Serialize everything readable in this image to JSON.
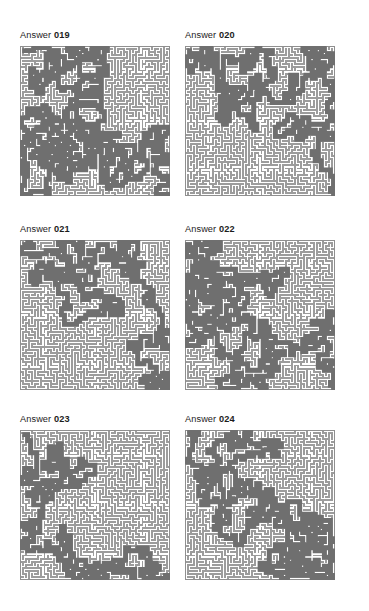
{
  "page": {
    "width": 369,
    "height": 611,
    "background": "#ffffff",
    "kind": "maze-answer-key-sheet",
    "label_prefix": "Answer"
  },
  "style": {
    "wall_color": "#9c9c9c",
    "border_color": "#8f8f8f",
    "solution_color": "#6f6f6f",
    "label_color": "#1c1c1c",
    "label_font_size_px": 9.2
  },
  "layout": {
    "columns": 2,
    "rows": 3,
    "column_x": [
      20,
      185
    ],
    "label_y": [
      30,
      224,
      414
    ],
    "maze_y": [
      46,
      240,
      430
    ],
    "maze_width": 150,
    "maze_height": 150
  },
  "panels": [
    {
      "id": "answer-019",
      "label_word": "Answer",
      "label_number": "019",
      "col": 0,
      "row": 0,
      "grid": 49,
      "seed": 19019,
      "start": [
        1,
        1
      ],
      "end": [
        48,
        48
      ],
      "entrance_side": "top-left",
      "exit_side": "bottom-right",
      "path_summary": "Descends the left quarter from the top-left, bends right across the middle, then steps down and right to the bottom-right corner."
    },
    {
      "id": "answer-020",
      "label_word": "Answer",
      "label_number": "020",
      "col": 1,
      "row": 0,
      "grid": 49,
      "seed": 20020,
      "start": [
        1,
        1
      ],
      "end": [
        48,
        48
      ],
      "entrance_side": "top-left",
      "exit_side": "bottom-right",
      "path_summary": "Runs diagonally from the top-left corner to the bottom-right corner with a wide loop through the centre."
    },
    {
      "id": "answer-021",
      "label_word": "Answer",
      "label_number": "021",
      "col": 0,
      "row": 1,
      "grid": 49,
      "seed": 21021,
      "start": [
        1,
        1
      ],
      "end": [
        48,
        48
      ],
      "entrance_side": "top-left",
      "exit_side": "bottom-right",
      "path_summary": "Sweeps right along the top, drops through the middle in a long S, then runs down the right side to the bottom-right corner."
    },
    {
      "id": "answer-022",
      "label_word": "Answer",
      "label_number": "022",
      "col": 1,
      "row": 1,
      "grid": 49,
      "seed": 22022,
      "start": [
        1,
        1
      ],
      "end": [
        48,
        48
      ],
      "entrance_side": "top-left",
      "exit_side": "bottom-right",
      "path_summary": "Falls down the left third, curves along the lower middle, climbs right of centre and exits at the bottom-right."
    },
    {
      "id": "answer-023",
      "label_word": "Answer",
      "label_number": "023",
      "col": 0,
      "row": 2,
      "grid": 49,
      "seed": 23023,
      "start": [
        1,
        1
      ],
      "end": [
        48,
        48
      ],
      "entrance_side": "top-left",
      "exit_side": "bottom-right",
      "path_summary": "Drops down the left edge, arcs up over the centre, then descends steadily to the bottom-right corner."
    },
    {
      "id": "answer-024",
      "label_word": "Answer",
      "label_number": "024",
      "col": 1,
      "row": 2,
      "grid": 49,
      "seed": 24024,
      "start": [
        1,
        1
      ],
      "end": [
        48,
        48
      ],
      "entrance_side": "top-left",
      "exit_side": "bottom-right",
      "path_summary": "Loops across the top, makes a large hook on the right, then winds down the right half to the bottom-right corner."
    }
  ]
}
